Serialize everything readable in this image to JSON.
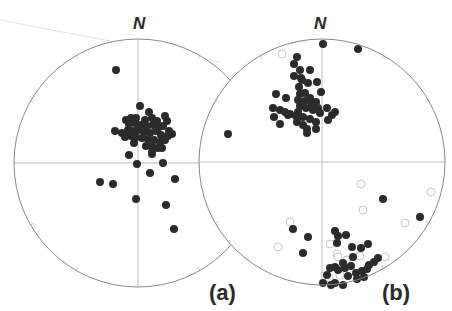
{
  "figure": {
    "panels": [
      {
        "id": "a",
        "label": "(a)",
        "north_label": "N",
        "center": [
          138,
          163
        ],
        "radius": 124,
        "filled_points": [
          [
            116,
            70
          ],
          [
            140,
            106
          ],
          [
            149,
            112
          ],
          [
            131,
            118
          ],
          [
            126,
            120
          ],
          [
            136,
            118
          ],
          [
            145,
            120
          ],
          [
            152,
            118
          ],
          [
            157,
            121
          ],
          [
            165,
            116
          ],
          [
            167,
            121
          ],
          [
            129,
            124
          ],
          [
            135,
            123
          ],
          [
            141,
            125
          ],
          [
            147,
            126
          ],
          [
            153,
            125
          ],
          [
            158,
            128
          ],
          [
            163,
            126
          ],
          [
            169,
            131
          ],
          [
            172,
            134
          ],
          [
            128,
            130
          ],
          [
            133,
            131
          ],
          [
            138,
            130
          ],
          [
            144,
            132
          ],
          [
            150,
            133
          ],
          [
            156,
            131
          ],
          [
            161,
            135
          ],
          [
            168,
            136
          ],
          [
            125,
            137
          ],
          [
            131,
            136
          ],
          [
            136,
            137
          ],
          [
            142,
            138
          ],
          [
            148,
            139
          ],
          [
            154,
            140
          ],
          [
            160,
            142
          ],
          [
            165,
            140
          ],
          [
            122,
            133
          ],
          [
            115,
            131
          ],
          [
            134,
            143
          ],
          [
            146,
            146
          ],
          [
            152,
            146
          ],
          [
            158,
            148
          ],
          [
            152,
            152
          ],
          [
            162,
            148
          ],
          [
            129,
            155
          ],
          [
            152,
            154
          ],
          [
            137,
            164
          ],
          [
            163,
            163
          ],
          [
            150,
            173
          ],
          [
            175,
            179
          ],
          [
            100,
            182
          ],
          [
            113,
            184
          ],
          [
            136,
            199
          ],
          [
            166,
            205
          ],
          [
            174,
            229
          ],
          [
            232,
            134
          ]
        ],
        "open_points": []
      },
      {
        "id": "b",
        "label": "(b)",
        "north_label": "N",
        "center": [
          322,
          162
        ],
        "radius": 123,
        "filled_points": [
          [
            323,
            44
          ],
          [
            358,
            49
          ],
          [
            297,
            57
          ],
          [
            294,
            64
          ],
          [
            300,
            70
          ],
          [
            294,
            76
          ],
          [
            301,
            78
          ],
          [
            310,
            70
          ],
          [
            308,
            83
          ],
          [
            299,
            87
          ],
          [
            302,
            80
          ],
          [
            317,
            82
          ],
          [
            321,
            92
          ],
          [
            305,
            93
          ],
          [
            300,
            94
          ],
          [
            310,
            98
          ],
          [
            316,
            102
          ],
          [
            276,
            94
          ],
          [
            286,
            98
          ],
          [
            298,
            100
          ],
          [
            305,
            101
          ],
          [
            312,
            104
          ],
          [
            318,
            108
          ],
          [
            300,
            106
          ],
          [
            306,
            108
          ],
          [
            313,
            110
          ],
          [
            320,
            113
          ],
          [
            298,
            112
          ],
          [
            273,
            108
          ],
          [
            280,
            110
          ],
          [
            285,
            112
          ],
          [
            290,
            114
          ],
          [
            288,
            115
          ],
          [
            296,
            116
          ],
          [
            303,
            117
          ],
          [
            310,
            119
          ],
          [
            316,
            122
          ],
          [
            274,
            117
          ],
          [
            280,
            124
          ],
          [
            297,
            122
          ],
          [
            303,
            125
          ],
          [
            307,
            129
          ],
          [
            316,
            129
          ],
          [
            307,
            133
          ],
          [
            327,
            108
          ],
          [
            335,
            112
          ],
          [
            332,
            115
          ],
          [
            328,
            120
          ],
          [
            228,
            134
          ],
          [
            383,
            199
          ],
          [
            420,
            217
          ],
          [
            293,
            229
          ],
          [
            308,
            237
          ],
          [
            335,
            231
          ],
          [
            338,
            236
          ],
          [
            346,
            235
          ],
          [
            337,
            243
          ],
          [
            303,
            253
          ],
          [
            352,
            247
          ],
          [
            361,
            248
          ],
          [
            368,
            244
          ],
          [
            353,
            257
          ],
          [
            343,
            263
          ],
          [
            335,
            267
          ],
          [
            330,
            268
          ],
          [
            327,
            275
          ],
          [
            323,
            283
          ],
          [
            338,
            270
          ],
          [
            345,
            268
          ],
          [
            351,
            266
          ],
          [
            356,
            273
          ],
          [
            362,
            271
          ],
          [
            367,
            269
          ],
          [
            374,
            262
          ],
          [
            378,
            258
          ],
          [
            348,
            276
          ],
          [
            335,
            283
          ],
          [
            331,
            285
          ],
          [
            343,
            285
          ],
          [
            357,
            279
          ],
          [
            364,
            277
          ],
          [
            369,
            265
          ]
        ],
        "open_points": [
          [
            282,
            54
          ],
          [
            361,
            184
          ],
          [
            431,
            192
          ],
          [
            363,
            210
          ],
          [
            405,
            223
          ],
          [
            290,
            222
          ],
          [
            278,
            247
          ],
          [
            330,
            244
          ],
          [
            337,
            254
          ],
          [
            338,
            257
          ],
          [
            347,
            260
          ],
          [
            360,
            256
          ],
          [
            385,
            257
          ],
          [
            329,
            278
          ],
          [
            340,
            275
          ],
          [
            351,
            271
          ]
        ]
      }
    ],
    "colors": {
      "filled_point": "#2b2b2b",
      "open_point_stroke": "#c8c8c8",
      "circle_stroke": "#888888",
      "cross_line": "#bdbdbd",
      "text": "#2a2a2a"
    }
  }
}
